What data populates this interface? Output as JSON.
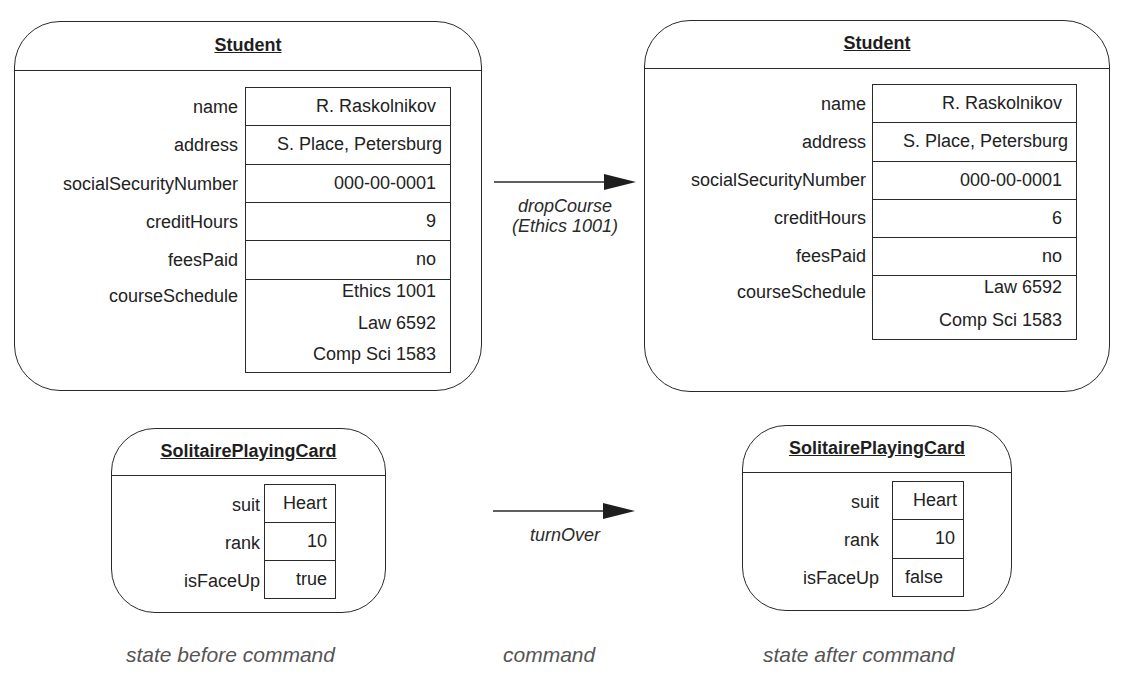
{
  "diagram": {
    "columns": {
      "before": "state before command",
      "command": "command",
      "after": "state after command"
    },
    "examples": [
      {
        "command": {
          "name": "dropCourse",
          "argument": "(Ethics 1001)"
        },
        "before": {
          "class": "Student",
          "attributes": [
            {
              "name": "name",
              "value": "R. Raskolnikov"
            },
            {
              "name": "address",
              "value": "S. Place, Petersburg"
            },
            {
              "name": "socialSecurityNumber",
              "value": "000-00-0001"
            },
            {
              "name": "creditHours",
              "value": "9"
            },
            {
              "name": "feesPaid",
              "value": "no"
            },
            {
              "name": "courseSchedule",
              "values": [
                "Ethics 1001",
                "Law 6592",
                "Comp Sci 1583"
              ]
            }
          ]
        },
        "after": {
          "class": "Student",
          "attributes": [
            {
              "name": "name",
              "value": "R. Raskolnikov"
            },
            {
              "name": "address",
              "value": "S. Place, Petersburg"
            },
            {
              "name": "socialSecurityNumber",
              "value": "000-00-0001"
            },
            {
              "name": "creditHours",
              "value": "6"
            },
            {
              "name": "feesPaid",
              "value": "no"
            },
            {
              "name": "courseSchedule",
              "values": [
                "Law 6592",
                "Comp Sci 1583"
              ]
            }
          ]
        }
      },
      {
        "command": {
          "name": "turnOver"
        },
        "before": {
          "class": "SolitairePlayingCard",
          "attributes": [
            {
              "name": "suit",
              "value": "Heart"
            },
            {
              "name": "rank",
              "value": "10"
            },
            {
              "name": "isFaceUp",
              "value": "true"
            }
          ]
        },
        "after": {
          "class": "SolitairePlayingCard",
          "attributes": [
            {
              "name": "suit",
              "value": "Heart"
            },
            {
              "name": "rank",
              "value": "10"
            },
            {
              "name": "isFaceUp",
              "value": "false"
            }
          ]
        }
      }
    ]
  }
}
